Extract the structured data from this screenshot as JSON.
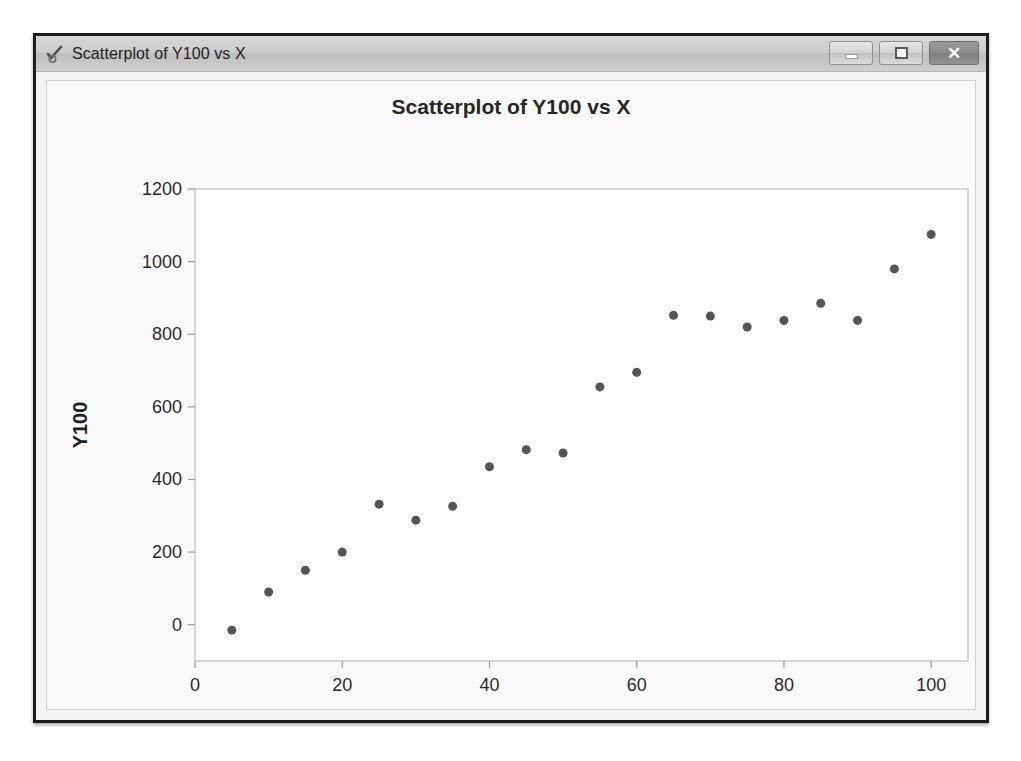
{
  "window": {
    "title": "Scatterplot of Y100 vs X",
    "icon": "minitab-graph-icon",
    "buttons": {
      "minimize": "minimize-icon",
      "maximize": "maximize-icon",
      "close": "✕"
    }
  },
  "chart_data": {
    "type": "scatter",
    "title": "Scatterplot of Y100 vs X",
    "xlabel": "X",
    "ylabel": "Y100",
    "xlim": [
      0,
      105
    ],
    "ylim": [
      -100,
      1200
    ],
    "xticks": [
      0,
      20,
      40,
      60,
      80,
      100
    ],
    "yticks": [
      0,
      200,
      400,
      600,
      800,
      1000,
      1200
    ],
    "grid": false,
    "legend": false,
    "marker_color": "#555555",
    "marker_size": 9,
    "series": [
      {
        "name": "Y100",
        "x": [
          5,
          10,
          15,
          20,
          25,
          30,
          35,
          40,
          45,
          50,
          55,
          60,
          65,
          70,
          75,
          80,
          85,
          90,
          95,
          100
        ],
        "y": [
          -15,
          90,
          150,
          200,
          332,
          288,
          326,
          435,
          482,
          473,
          655,
          695,
          852,
          850,
          820,
          838,
          885,
          838,
          980,
          1075
        ]
      }
    ]
  }
}
